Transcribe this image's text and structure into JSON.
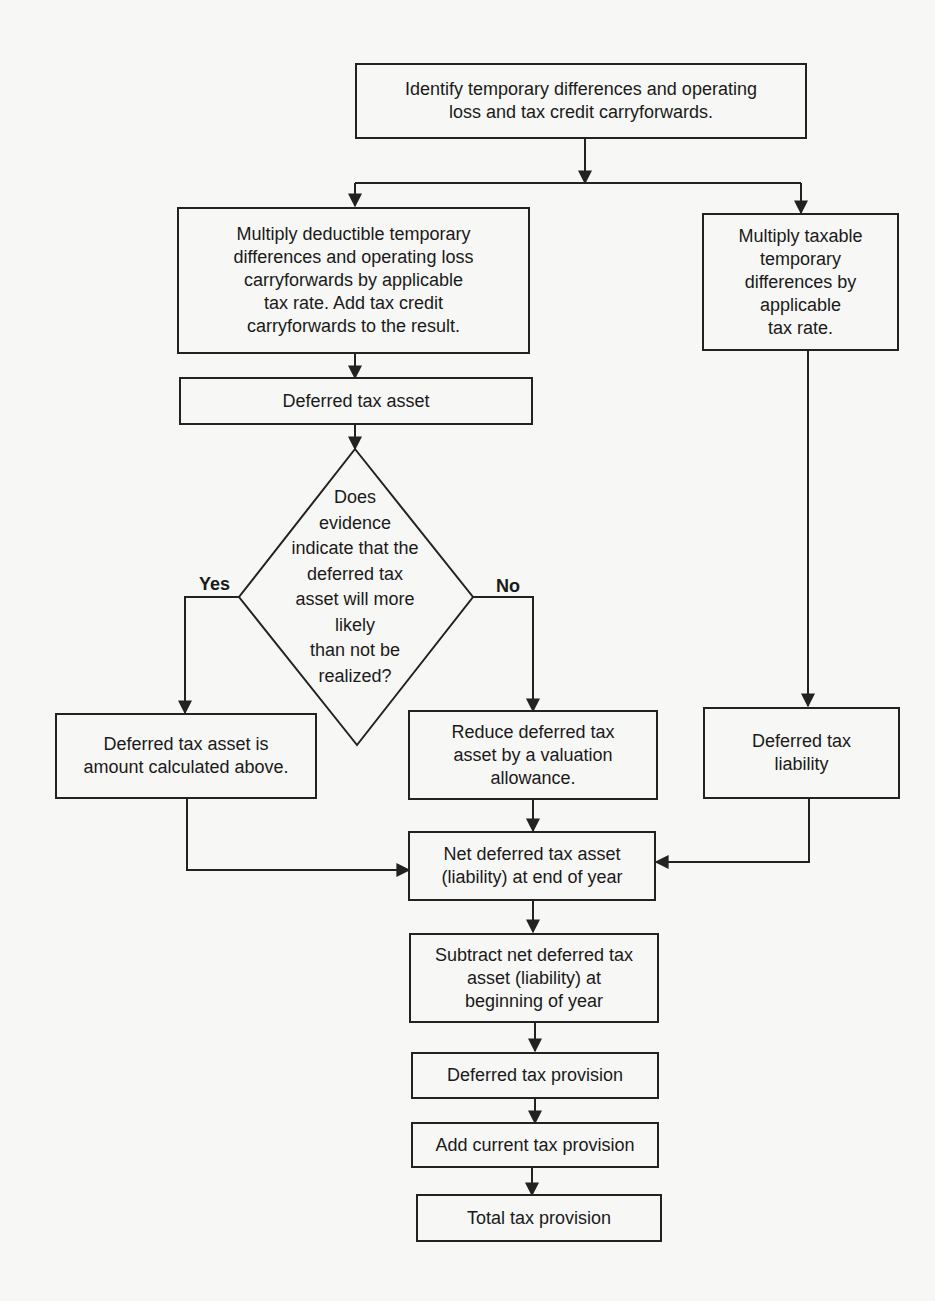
{
  "flowchart": {
    "nodes": {
      "identify": "Identify temporary differences and operating\nloss and tax credit carryforwards.",
      "multiply_deductible": "Multiply deductible temporary\ndifferences and operating loss\ncarryforwards by applicable\ntax rate. Add tax credit\ncarryforwards to the result.",
      "multiply_taxable": "Multiply taxable\ntemporary\ndifferences by\napplicable\ntax rate.",
      "deferred_tax_asset": "Deferred tax asset",
      "decision": "Does\nevidence\nindicate that the\ndeferred tax\nasset will more\nlikely\nthan not be\nrealized?",
      "asset_calculated": "Deferred tax asset is\namount calculated above.",
      "reduce_valuation": "Reduce deferred tax\nasset by a valuation\nallowance.",
      "deferred_tax_liability": "Deferred tax\nliability",
      "net_end_of_year": "Net deferred tax asset\n(liability) at end of year",
      "subtract_beginning": "Subtract net deferred tax\nasset (liability) at\nbeginning of year",
      "deferred_tax_provision": "Deferred tax provision",
      "add_current": "Add current tax provision",
      "total_tax_provision": "Total tax provision"
    },
    "branch_labels": {
      "yes": "Yes",
      "no": "No"
    }
  }
}
